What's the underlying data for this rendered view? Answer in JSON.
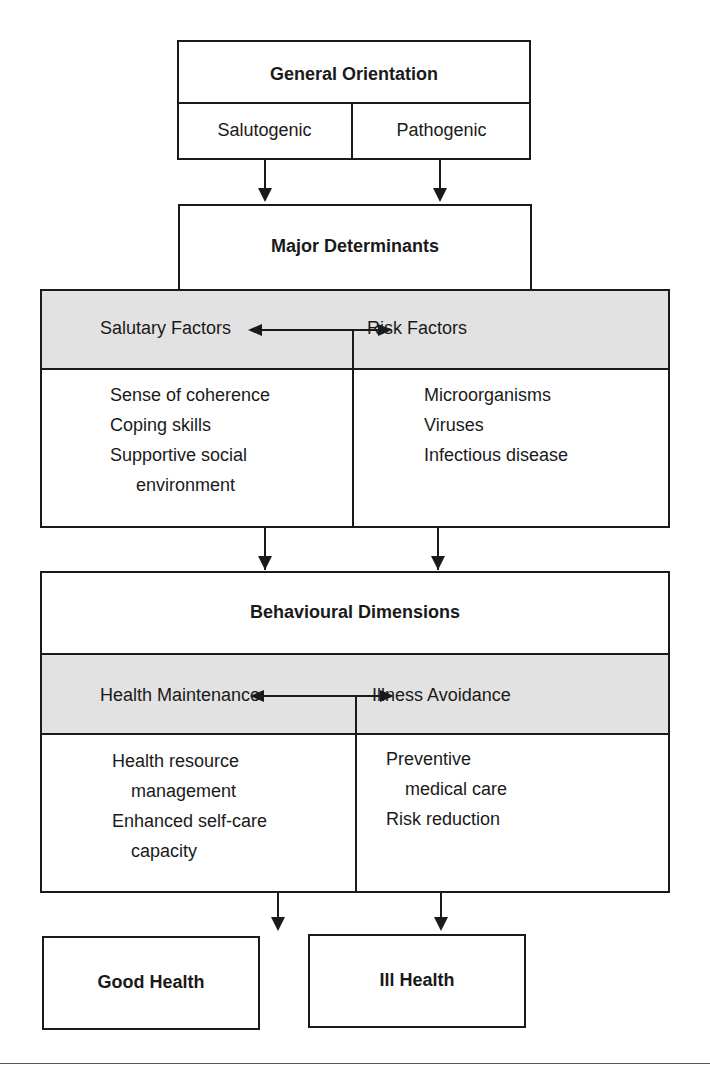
{
  "general_orientation": {
    "title": "General Orientation",
    "left": "Salutogenic",
    "right": "Pathogenic"
  },
  "major_determinants": {
    "title": "Major Determinants",
    "left_header": "Salutary Factors",
    "right_header": "Risk Factors",
    "left_items": [
      "Sense of coherence",
      "Coping skills",
      "Supportive social",
      "environment"
    ],
    "right_items": [
      "Microorganisms",
      "Viruses",
      "Infectious disease"
    ]
  },
  "behavioural_dimensions": {
    "title": "Behavioural Dimensions",
    "left_header": "Health Maintenance",
    "right_header": "Illness Avoidance",
    "left_items": [
      "Health resource",
      "management",
      "Enhanced self-care",
      "capacity"
    ],
    "right_items": [
      "Preventive",
      "medical care",
      "Risk reduction"
    ]
  },
  "outcomes": {
    "left": "Good Health",
    "right": "Ill Health"
  },
  "colors": {
    "line": "#1a1a1a",
    "header_fill": "#e2e2e2"
  }
}
